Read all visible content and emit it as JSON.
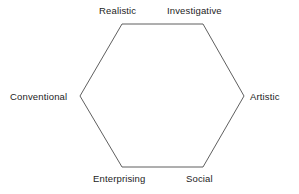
{
  "diagram": {
    "type": "hexagon",
    "shape_name": "riasec-hexagon",
    "stroke_color": "#4d4d4d",
    "fill_color": "none",
    "background_color": "#ffffff",
    "text_color": "#1c1c1c",
    "vertices": [
      {
        "id": "realistic",
        "label": "Realistic",
        "x": 122,
        "y": 24,
        "position": "top-left"
      },
      {
        "id": "investigative",
        "label": "Investigative",
        "x": 203,
        "y": 24,
        "position": "top-right"
      },
      {
        "id": "artistic",
        "label": "Artistic",
        "x": 244,
        "y": 96,
        "position": "right"
      },
      {
        "id": "social",
        "label": "Social",
        "x": 203,
        "y": 167,
        "position": "bottom-right"
      },
      {
        "id": "enterprising",
        "label": "Enterprising",
        "x": 122,
        "y": 167,
        "position": "bottom-left"
      },
      {
        "id": "conventional",
        "label": "Conventional",
        "x": 80,
        "y": 96,
        "position": "left"
      }
    ],
    "points_attr": "122,24 203,24 244,96 203,167 122,167 80,96"
  }
}
